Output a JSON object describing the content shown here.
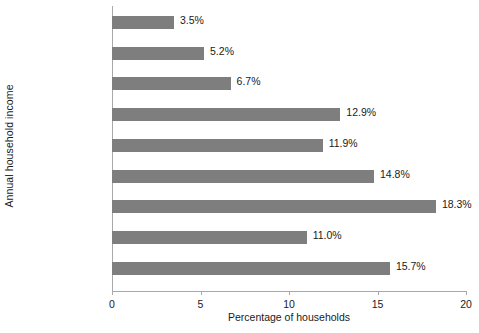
{
  "chart_data": {
    "type": "bar",
    "orientation": "horizontal",
    "title": "",
    "xlabel": "Percentage of households",
    "ylabel": "Annual household income",
    "categories": [
      "Under $5,000",
      "$5,000–9,999",
      "$10,000–14,999",
      "$15,000–24,999",
      "$25,000–34,999",
      "$35,000–49,999",
      "$50,000–74,999",
      "$75,000–99,999",
      "$100,000 and over"
    ],
    "values": [
      3.5,
      5.2,
      6.7,
      12.9,
      11.9,
      14.8,
      18.3,
      11.0,
      15.7
    ],
    "value_labels": [
      "3.5%",
      "5.2%",
      "6.7%",
      "12.9%",
      "11.9%",
      "14.8%",
      "18.3%",
      "11.0%",
      "15.7%"
    ],
    "xlim": [
      0,
      20
    ],
    "xticks": [
      0,
      5,
      10,
      15,
      20
    ],
    "xtick_labels": [
      "0",
      "5",
      "10",
      "15",
      "20"
    ],
    "grid": false,
    "legend": false,
    "bar_color": "#7e7e7e",
    "axis_color": "#a8a8a8",
    "text_color": "#1a1a1a",
    "background": "#ffffff"
  }
}
